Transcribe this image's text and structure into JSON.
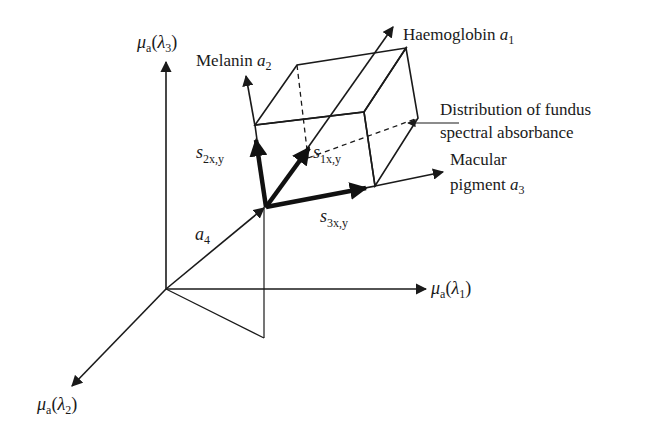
{
  "figure": {
    "type": "3D vector space diagram",
    "axes": {
      "lambda3": {
        "symbol": "μ",
        "sub": "a",
        "paren_open": "(",
        "var": "λ",
        "var_sub": "3",
        "paren_close": ")"
      },
      "lambda1": {
        "symbol": "μ",
        "sub": "a",
        "paren_open": "(",
        "var": "λ",
        "var_sub": "1",
        "paren_close": ")"
      },
      "lambda2": {
        "symbol": "μ",
        "sub": "a",
        "paren_open": "(",
        "var": "λ",
        "var_sub": "2",
        "paren_close": ")"
      }
    },
    "vectors": {
      "haemoglobin": {
        "text": "Haemoglobin ",
        "var": "a",
        "sub": "1"
      },
      "melanin": {
        "text": "Melanin ",
        "var": "a",
        "sub": "2"
      },
      "macular_line1": "Macular",
      "macular_line2": {
        "text": "pigment ",
        "var": "a",
        "sub": "3"
      },
      "a4": {
        "var": "a",
        "sub": "4"
      }
    },
    "coefficients": {
      "s1": {
        "var": "s",
        "sub": "1x,y"
      },
      "s2": {
        "var": "s",
        "sub": "2x,y"
      },
      "s3": {
        "var": "s",
        "sub": "3x,y"
      }
    },
    "annotation": {
      "line1": "Distribution of fundus",
      "line2": "spectral absorbance"
    },
    "colors": {
      "shaded_face": "#a9a9a9",
      "front_face": "#f4f4f4",
      "dots": "#8c8c8c",
      "ink": "#1a1a1a"
    }
  }
}
